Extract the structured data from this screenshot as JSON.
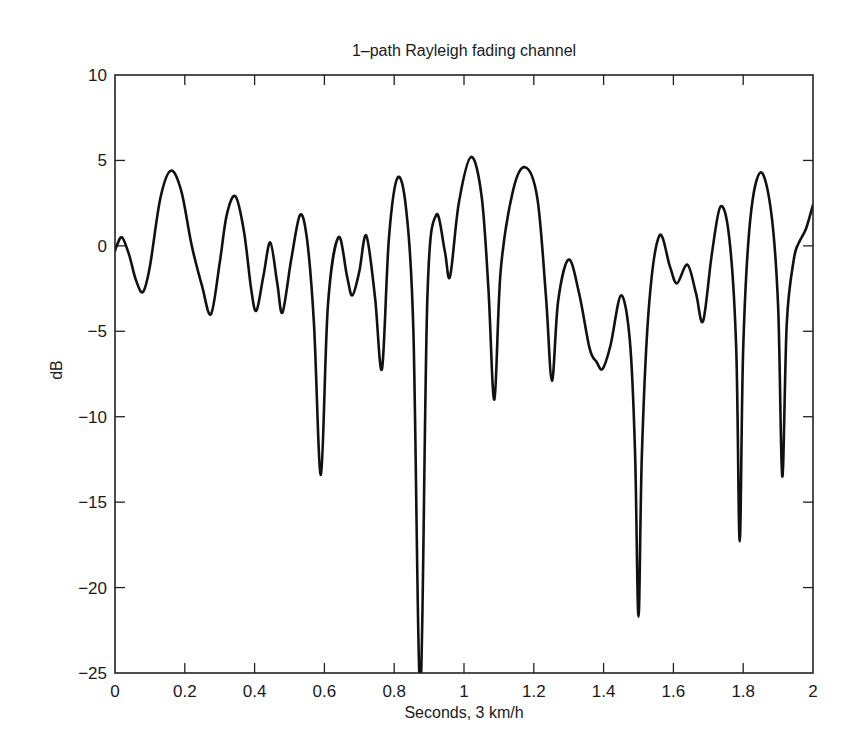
{
  "chart_data": {
    "type": "line",
    "title": "1–path Rayleigh fading channel",
    "xlabel": "Seconds, 3 km/h",
    "ylabel": "dB",
    "xlim": [
      0,
      2
    ],
    "ylim": [
      -25,
      10
    ],
    "xticks": [
      0,
      0.2,
      0.4,
      0.6,
      0.8,
      1,
      1.2,
      1.4,
      1.6,
      1.8,
      2
    ],
    "xtick_labels": [
      "0",
      "0.2",
      "0.4",
      "0.6",
      "0.8",
      "1",
      "1.2",
      "1.4",
      "1.6",
      "1.8",
      "2"
    ],
    "yticks": [
      10,
      5,
      0,
      -5,
      -10,
      -15,
      -20,
      -25
    ],
    "ytick_labels": [
      "10",
      "5",
      "0",
      "−5",
      "−10",
      "−15",
      "−20",
      "−25"
    ],
    "grid": false,
    "legend": null,
    "line_color": "#111111",
    "series": [
      {
        "name": "Rayleigh fading envelope",
        "x": [
          0.0,
          0.005,
          0.02,
          0.04,
          0.06,
          0.08,
          0.1,
          0.13,
          0.16,
          0.19,
          0.22,
          0.25,
          0.275,
          0.3,
          0.32,
          0.345,
          0.37,
          0.39,
          0.405,
          0.425,
          0.445,
          0.465,
          0.48,
          0.505,
          0.53,
          0.55,
          0.57,
          0.59,
          0.61,
          0.64,
          0.665,
          0.68,
          0.7,
          0.72,
          0.745,
          0.765,
          0.785,
          0.81,
          0.835,
          0.855,
          0.875,
          0.895,
          0.92,
          0.945,
          0.96,
          0.985,
          1.02,
          1.05,
          1.07,
          1.087,
          1.105,
          1.14,
          1.175,
          1.21,
          1.235,
          1.252,
          1.27,
          1.3,
          1.33,
          1.36,
          1.38,
          1.397,
          1.42,
          1.45,
          1.475,
          1.49,
          1.5,
          1.51,
          1.53,
          1.56,
          1.59,
          1.61,
          1.64,
          1.665,
          1.685,
          1.71,
          1.735,
          1.76,
          1.78,
          1.79,
          1.8,
          1.82,
          1.85,
          1.88,
          1.9,
          1.912,
          1.925,
          1.945,
          1.96,
          1.98,
          2.0
        ],
        "y": [
          -0.3,
          0.0,
          0.5,
          -0.5,
          -2.0,
          -2.7,
          -1.2,
          2.8,
          4.4,
          3.2,
          0.0,
          -2.4,
          -4.0,
          -1.0,
          1.8,
          2.9,
          0.8,
          -2.5,
          -3.8,
          -1.8,
          0.2,
          -2.2,
          -3.9,
          -0.8,
          1.8,
          0.4,
          -4.5,
          -13.4,
          -3.5,
          0.5,
          -1.8,
          -2.9,
          -1.5,
          0.6,
          -3.0,
          -7.2,
          0.5,
          4.0,
          2.0,
          -5.0,
          -26.0,
          -3.0,
          1.8,
          -0.3,
          -1.8,
          2.5,
          5.2,
          3.0,
          -2.5,
          -9.0,
          -1.5,
          3.2,
          4.6,
          2.8,
          -3.0,
          -7.9,
          -3.2,
          -0.8,
          -2.8,
          -6.0,
          -6.8,
          -7.2,
          -5.8,
          -2.9,
          -5.5,
          -12.0,
          -21.7,
          -12.0,
          -3.5,
          0.6,
          -1.2,
          -2.2,
          -1.1,
          -2.8,
          -4.4,
          -0.5,
          2.3,
          0.5,
          -6.0,
          -17.3,
          -6.0,
          1.5,
          4.3,
          2.0,
          -3.5,
          -13.5,
          -4.5,
          -0.8,
          0.2,
          1.0,
          2.4
        ]
      }
    ]
  }
}
